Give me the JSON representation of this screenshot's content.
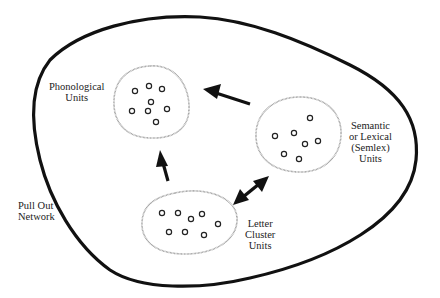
{
  "diagram": {
    "type": "network-of-unit-clusters",
    "outer_region": {
      "label_lines": [
        "Pull Out",
        "Network"
      ]
    },
    "clusters": [
      {
        "id": "phonological",
        "label_lines": [
          "Phonological",
          "Units"
        ],
        "unit_count": 8
      },
      {
        "id": "semlex",
        "label_lines": [
          "Semantic",
          "or Lexical",
          "(Semlex)",
          "Units"
        ],
        "unit_count": 7
      },
      {
        "id": "letter",
        "label_lines": [
          "Letter",
          "Cluster",
          "Units"
        ],
        "unit_count": 8
      }
    ],
    "connections": [
      {
        "from": "semlex",
        "to": "phonological",
        "direction": "one-way"
      },
      {
        "from": "letter",
        "to": "phonological",
        "direction": "one-way"
      },
      {
        "from": "letter",
        "to": "semlex",
        "direction": "two-way"
      }
    ],
    "colors": {
      "outline": "#111111",
      "cluster_outline": "#9a9a9a",
      "unit": "#222222",
      "text": "#222222"
    }
  }
}
